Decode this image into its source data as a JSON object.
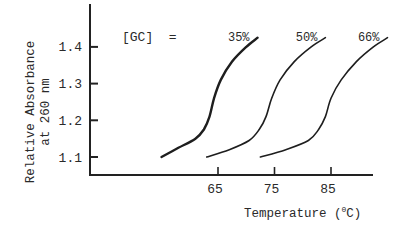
{
  "chart_data": {
    "type": "line",
    "title": "",
    "xlabel": "Temperature (°C)",
    "xlabel_parts": {
      "pre": "Temperature (",
      "sup": "0",
      "post": "C)"
    },
    "ylabel_line1": "Relative Absorbance",
    "ylabel_line2": "at 260 nm",
    "ylabel": "Relative Absorbance at 260 nm",
    "legend_prefix": "[GC]  =",
    "x_ticks": [
      65,
      75,
      85
    ],
    "y_ticks": [
      1.1,
      1.2,
      1.3,
      1.4
    ],
    "xlim": [
      43,
      97
    ],
    "ylim": [
      1.05,
      1.48
    ],
    "grid": false,
    "series": [
      {
        "name": "35%",
        "label": "35%",
        "x": [
          55,
          58,
          61,
          62.5,
          63.5,
          64.3,
          65.5,
          67.5,
          70,
          72
        ],
        "y": [
          1.1,
          1.125,
          1.15,
          1.175,
          1.21,
          1.26,
          1.31,
          1.36,
          1.4,
          1.425
        ]
      },
      {
        "name": "50%",
        "label": "50%",
        "x": [
          63,
          67,
          70.5,
          72.3,
          73.5,
          74.5,
          76,
          78.5,
          81.5,
          84
        ],
        "y": [
          1.1,
          1.12,
          1.145,
          1.175,
          1.21,
          1.26,
          1.31,
          1.36,
          1.4,
          1.425
        ]
      },
      {
        "name": "66%",
        "label": "66%",
        "x": [
          72.5,
          77,
          81,
          82.8,
          84,
          85,
          86.8,
          89.5,
          92.5,
          95
        ],
        "y": [
          1.1,
          1.12,
          1.145,
          1.175,
          1.21,
          1.26,
          1.31,
          1.36,
          1.4,
          1.425
        ]
      }
    ],
    "colors": {
      "ink": "#222222",
      "background": "#ffffff"
    }
  }
}
